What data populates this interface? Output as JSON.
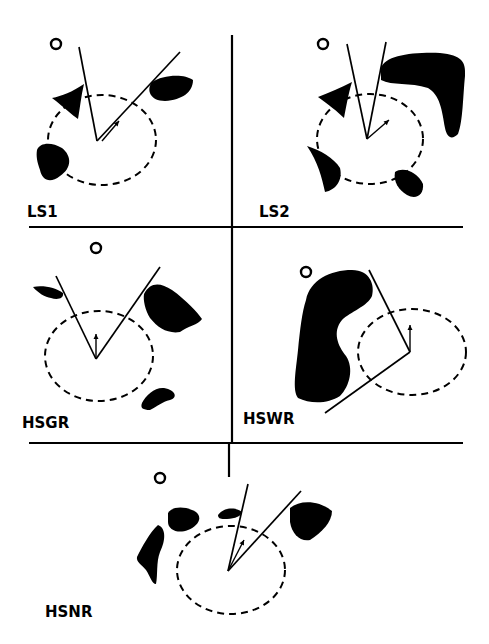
{
  "figure": {
    "panels": [
      {
        "id": "LS1",
        "label": "LS1",
        "label_pos": [
          27,
          217
        ],
        "goal": [
          56,
          44
        ],
        "robot": [
          97,
          141
        ],
        "rays": [
          [
            79,
            47
          ],
          [
            180,
            52
          ]
        ],
        "sensing_ellipse": {
          "cx": 102,
          "cy": 140,
          "rx": 54,
          "ry": 45
        },
        "heading_arrow": [
          [
            102,
            141
          ],
          [
            119,
            121
          ]
        ],
        "obstacles": [
          "M52,98 C62,96 72,92 84,84 C81,96 80,108 78,119 C72,115 65,108 52,98 Z",
          "M152,82 C162,75 184,73 193,80 C193,92 182,100 165,101 C150,101 146,90 152,82 Z",
          "M37,150 C40,142 52,142 62,148 C72,156 72,168 60,176 C50,184 42,180 40,170 C37,162 36,156 37,150 Z"
        ]
      },
      {
        "id": "LS2",
        "label": "LS2",
        "label_pos": [
          259,
          217
        ],
        "goal": [
          323,
          44
        ],
        "robot": [
          367,
          139
        ],
        "rays": [
          [
            347,
            44
          ],
          [
            386,
            42
          ]
        ],
        "sensing_ellipse": {
          "cx": 370,
          "cy": 139,
          "rx": 53,
          "ry": 45
        },
        "heading_arrow": [
          [
            367,
            139
          ],
          [
            389,
            120
          ]
        ],
        "obstacles": [
          "M381,68 C385,56 410,52 440,53 C462,55 466,62 465,76 C463,95 463,122 458,134 C452,140 447,138 445,128 C442,110 440,95 428,88 C410,82 392,86 381,80 Z",
          "M318,97 C330,92 340,88 352,82 C348,95 346,108 344,118 C338,112 328,104 318,97 Z",
          "M307,146 C320,150 334,158 340,168 C343,180 336,190 325,192 C322,178 318,162 307,146 Z",
          "M395,172 C403,166 418,172 423,184 C424,195 416,200 407,195 C399,190 393,182 395,172 Z"
        ]
      },
      {
        "id": "HSGR",
        "label": "HSGR",
        "label_pos": [
          22,
          428
        ],
        "goal": [
          96,
          248
        ],
        "robot": [
          96,
          359
        ],
        "rays": [
          [
            56,
            276
          ],
          [
            160,
            267
          ]
        ],
        "sensing_ellipse": {
          "cx": 99,
          "cy": 356,
          "rx": 54,
          "ry": 45
        },
        "heading_arrow": [
          [
            96,
            359
          ],
          [
            96,
            334
          ]
        ],
        "obstacles": [
          "M33,287 C44,285 56,288 63,293 C64,299 57,300 51,298 C45,297 38,293 33,287 Z",
          "M144,294 C150,282 160,282 172,290 C186,300 198,313 202,319 C198,325 188,326 180,332 C168,334 158,328 150,318 C145,310 143,300 144,294 Z",
          "M142,403 C146,395 155,387 164,388 C176,390 178,398 170,400 C162,402 158,406 150,410 C143,410 140,408 142,403 Z"
        ]
      },
      {
        "id": "HSWR",
        "label": "HSWR",
        "label_pos": [
          243,
          424
        ],
        "goal": [
          306,
          272
        ],
        "robot": [
          410,
          352
        ],
        "rays": [
          [
            369,
            270
          ],
          [
            325,
            413
          ]
        ],
        "sensing_ellipse": {
          "cx": 412,
          "cy": 352,
          "rx": 54,
          "ry": 43
        },
        "heading_arrow": [
          [
            410,
            352
          ],
          [
            410,
            325
          ]
        ],
        "obstacles": [
          "M306,300 C310,280 330,270 352,270 C370,270 375,285 372,296 C368,306 350,312 342,320 C332,332 338,346 346,356 C354,368 350,386 340,396 C328,404 310,404 298,398 C292,390 296,370 298,350 C300,330 302,312 306,300 Z"
        ]
      },
      {
        "id": "HSNR",
        "label": "HSNR",
        "label_pos": [
          45,
          617
        ],
        "goal": [
          160,
          478
        ],
        "robot": [
          228,
          571
        ],
        "rays": [
          [
            248,
            484
          ],
          [
            301,
            491
          ]
        ],
        "sensing_ellipse": {
          "cx": 231,
          "cy": 570,
          "rx": 54,
          "ry": 44
        },
        "heading_arrow": [
          [
            228,
            571
          ],
          [
            244,
            540
          ]
        ],
        "obstacles": [
          "M137,557 C142,547 150,532 158,525 C166,528 166,540 160,552 C156,562 158,575 156,584 C152,584 150,576 146,570 C142,565 136,562 137,557 Z",
          "M168,513 C172,506 186,506 196,512 C203,518 198,526 188,530 C178,534 168,530 168,522 Z",
          "M218,515 C224,507 236,507 242,512 C240,518 232,519 224,519 C220,519 218,518 218,515 Z",
          "M290,508 C300,500 318,500 332,511 C332,522 322,532 310,540 C300,542 292,534 290,522 Z"
        ]
      }
    ],
    "dividers": {
      "vertical_top": [
        [
          232,
          35
        ],
        [
          232,
          443
        ]
      ],
      "vertical_bottom": [
        [
          229,
          443
        ],
        [
          229,
          477
        ]
      ],
      "horizontal_1": [
        [
          29,
          227
        ],
        [
          463,
          227
        ]
      ],
      "horizontal_2": [
        [
          29,
          443
        ],
        [
          463,
          443
        ]
      ]
    }
  }
}
